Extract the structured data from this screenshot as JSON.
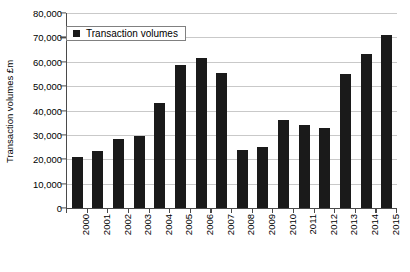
{
  "chart_data": {
    "type": "bar",
    "title": "",
    "subtitle": "",
    "xlabel": "",
    "ylabel": "Transaction volumes £m",
    "categories": [
      "2000",
      "2001",
      "2002",
      "2003",
      "2004",
      "2005",
      "2006",
      "2007",
      "2008",
      "2009",
      "2010",
      "2011",
      "2012",
      "2013",
      "2014",
      "2015"
    ],
    "values": [
      21000,
      23500,
      28500,
      29500,
      43000,
      58500,
      61500,
      55500,
      24000,
      25000,
      36000,
      34000,
      33000,
      55000,
      63000,
      71000
    ],
    "series": [
      {
        "name": "Transaction volumes",
        "values": [
          21000,
          23500,
          28500,
          29500,
          43000,
          58500,
          61500,
          55500,
          24000,
          25000,
          36000,
          34000,
          33000,
          55000,
          63000,
          71000
        ]
      }
    ],
    "ylim": [
      0,
      80000
    ],
    "ytick_labels": [
      "0",
      "10,000",
      "20,000",
      "30,000",
      "40,000",
      "50,000",
      "60,000",
      "70,000",
      "80,000"
    ],
    "ytick_values": [
      0,
      10000,
      20000,
      30000,
      40000,
      50000,
      60000,
      70000,
      80000
    ],
    "grid": true,
    "grid_axis": "y",
    "legend": {
      "position": "top-left-inside",
      "entries": [
        {
          "label": "Transaction volumes",
          "color": "#1a1a1a",
          "marker": "square"
        }
      ]
    },
    "bar_color": "#1a1a1a",
    "axis_color": "#4a4a4a",
    "grid_color": "#c9c9c9",
    "background": "#ffffff"
  }
}
